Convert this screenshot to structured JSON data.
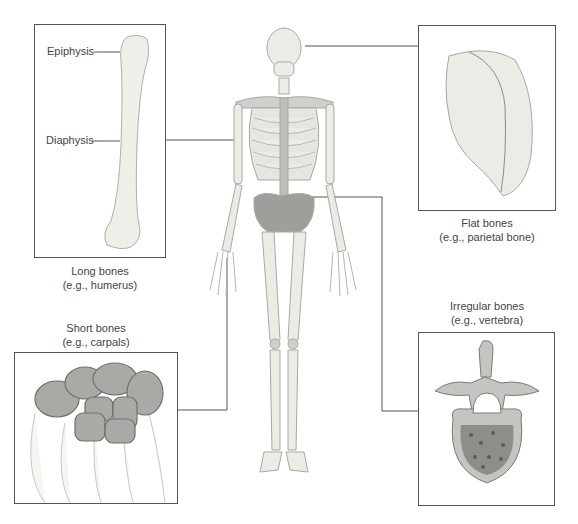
{
  "figure": {
    "panels": [
      {
        "id": "long",
        "title": "Long bones",
        "example": "(e.g., humerus)",
        "labels": [
          "Epiphysis",
          "Diaphysis"
        ]
      },
      {
        "id": "flat",
        "title": "Flat bones",
        "example": "(e.g., parietal bone)"
      },
      {
        "id": "short",
        "title": "Short bones",
        "example": "(e.g., carpals)"
      },
      {
        "id": "irregular",
        "title": "Irregular bones",
        "example": "(e.g., vertebra)"
      }
    ],
    "colors": {
      "line": "#555555",
      "bone": "#ecebe6",
      "bone_shade": "#bdbdb8",
      "dark_bone": "#8f8f8c"
    }
  }
}
